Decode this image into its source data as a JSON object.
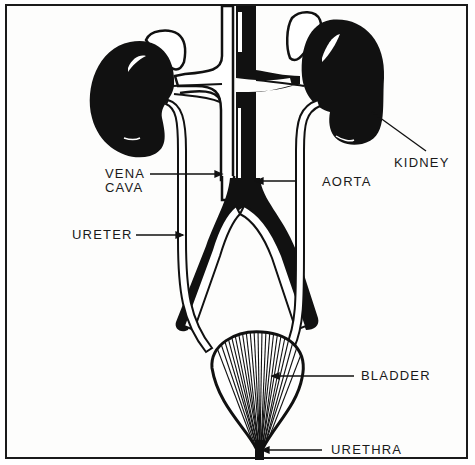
{
  "diagram": {
    "colors": {
      "ink": "#111111",
      "paper": "#fdfdfc",
      "border": "#1a1a1a"
    },
    "labels": {
      "vena_cava_line1": "VENA",
      "vena_cava_line2": "CAVA",
      "aorta": "AORTA",
      "kidney": "KIDNEY",
      "ureter": "URETER",
      "bladder": "BLADDER",
      "urethra": "URETHRA"
    },
    "structures": [
      "left-kidney",
      "right-kidney",
      "left-adrenal-gland",
      "right-adrenal-gland",
      "vena-cava",
      "aorta",
      "left-ureter",
      "right-ureter",
      "iliac-arteries",
      "iliac-veins",
      "bladder",
      "urethra"
    ]
  }
}
